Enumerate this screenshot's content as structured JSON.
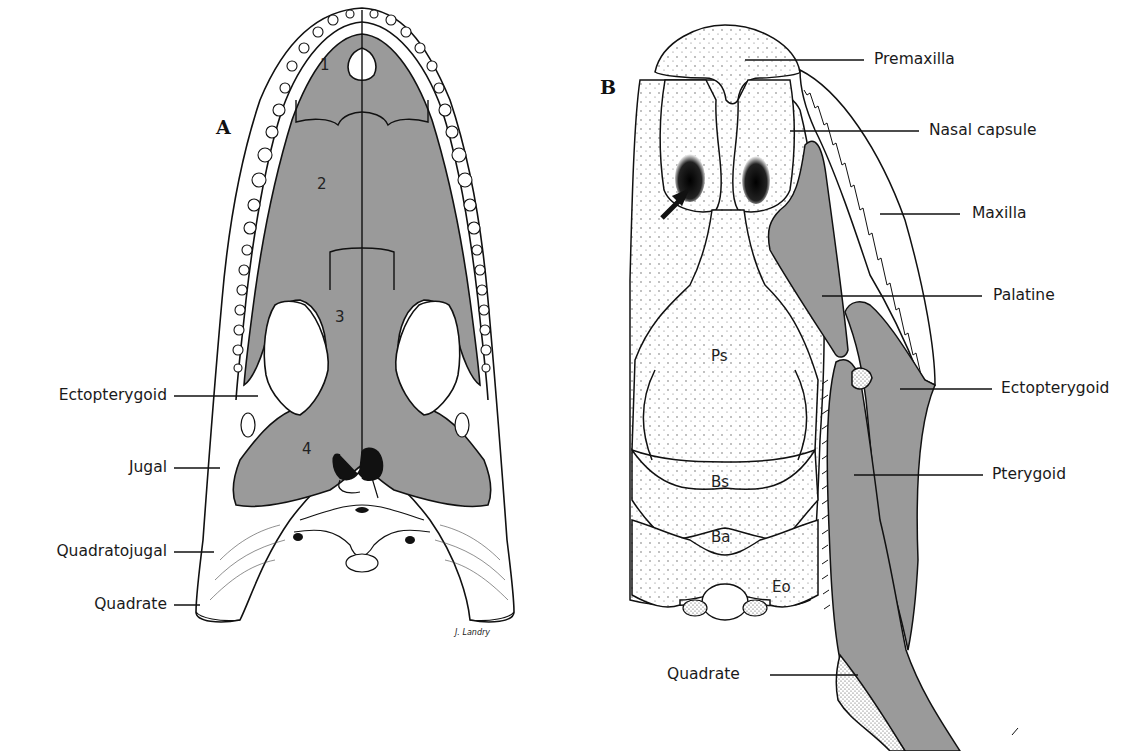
{
  "figure": {
    "panels": [
      {
        "id": "A",
        "label": "A",
        "bone_numbers": [
          "1",
          "2",
          "3",
          "4"
        ],
        "labels": [
          "Ectopterygoid",
          "Jugal",
          "Quadratojugal",
          "Quadrate"
        ],
        "signature": "J. Landry"
      },
      {
        "id": "B",
        "label": "B",
        "labels": [
          "Premaxilla",
          "Nasal capsule",
          "Maxilla",
          "Palatine",
          "Ectopterygoid",
          "Pterygoid",
          "Quadrate"
        ],
        "bone_abbreviations": [
          "Ps",
          "Bs",
          "Ba",
          "Eo"
        ]
      }
    ],
    "colors": {
      "shaded_bone": "#9a9a9a",
      "outline": "#111111",
      "background": "#ffffff"
    }
  }
}
